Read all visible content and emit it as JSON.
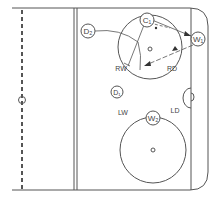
{
  "diagram": {
    "type": "hockey-rink-zone-play",
    "colors": {
      "line": "#555555",
      "text": "#444444",
      "background": "#ffffff"
    },
    "players": [
      {
        "id": "D2",
        "label": "D₂",
        "x": 88,
        "y": 31
      },
      {
        "id": "C1",
        "label": "C₁",
        "x": 147,
        "y": 20
      },
      {
        "id": "W1",
        "label": "W₁",
        "x": 198,
        "y": 39
      },
      {
        "id": "D1",
        "label": "D₁",
        "x": 117,
        "y": 92
      },
      {
        "id": "W2",
        "label": "W₂",
        "x": 153,
        "y": 118
      }
    ],
    "positions": [
      {
        "label": "RW",
        "x": 117,
        "y": 68
      },
      {
        "label": "RD",
        "x": 170,
        "y": 68
      },
      {
        "label": "LW",
        "x": 120,
        "y": 113
      },
      {
        "label": "LD",
        "x": 172,
        "y": 112
      }
    ],
    "goal_label": "B"
  }
}
